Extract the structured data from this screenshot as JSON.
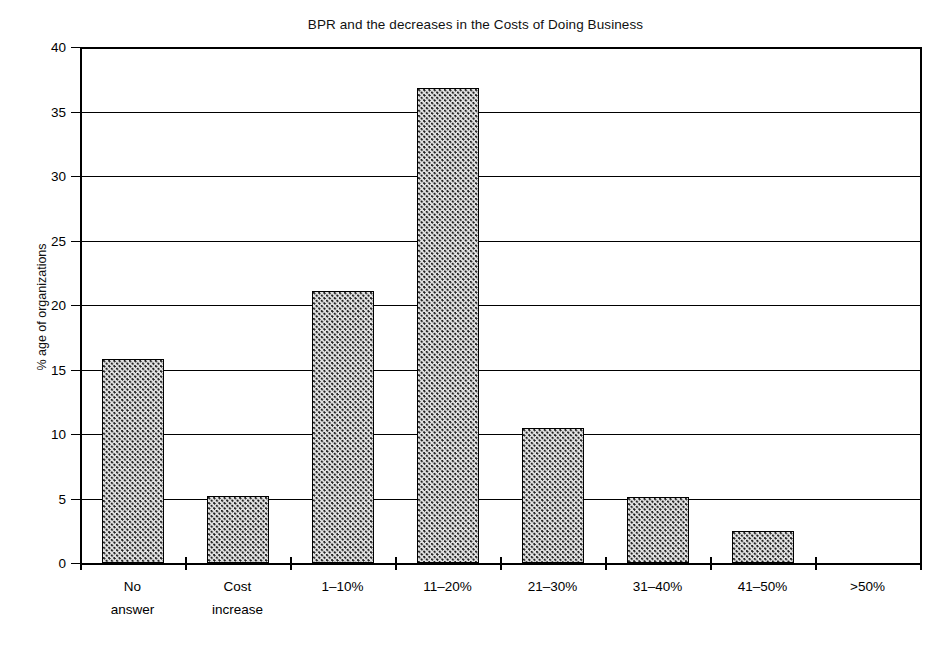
{
  "chart_data": {
    "type": "bar",
    "title": "BPR and the decreases in the Costs of Doing Business",
    "xlabel": "",
    "ylabel": "% age of organizations",
    "categories": [
      "No answer",
      "Cost increase",
      "1–10%",
      "11–20%",
      "21–30%",
      "31–40%",
      "41–50%",
      ">50%"
    ],
    "category_lines": [
      [
        "No",
        "answer"
      ],
      [
        "Cost",
        "increase"
      ],
      [
        "1–10%"
      ],
      [
        "11–20%"
      ],
      [
        "21–30%"
      ],
      [
        "31–40%"
      ],
      [
        "41–50%"
      ],
      [
        ">50%"
      ]
    ],
    "values": [
      15.8,
      5.2,
      21.1,
      36.8,
      10.5,
      5.1,
      2.5,
      0
    ],
    "ylim": [
      0,
      40
    ],
    "yticks": [
      0,
      5,
      10,
      15,
      20,
      25,
      30,
      35,
      40
    ],
    "ytick_labels": [
      "0",
      "5",
      "10",
      "15",
      "20",
      "25",
      "30",
      "35",
      "40"
    ],
    "grid": true,
    "legend": false,
    "bar_fill": "#e2e2e2",
    "bar_edge": "#000000",
    "bar_pattern": "fine-dotted-checker"
  }
}
